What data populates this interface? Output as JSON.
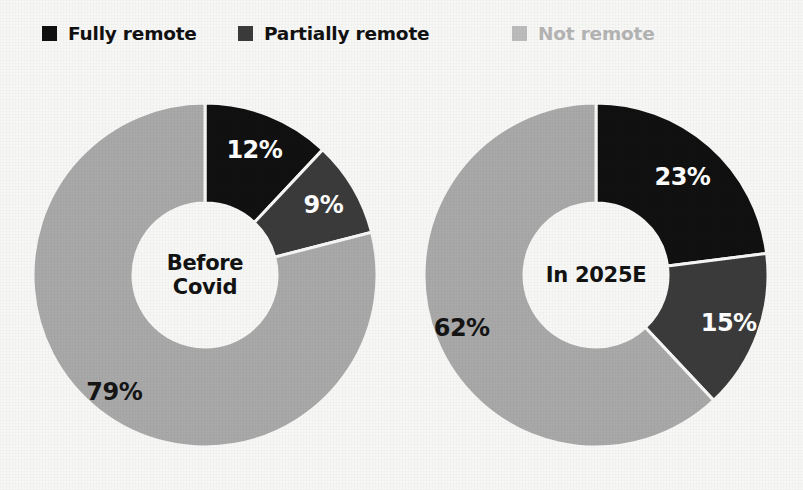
{
  "background_color": "#f7f7f6",
  "legend": {
    "items": [
      {
        "label": "Fully remote",
        "swatch_color": "#111111",
        "text_color": "#111111",
        "icon": "square-swatch-icon"
      },
      {
        "label": "Partially remote",
        "swatch_color": "#3b3b3b",
        "text_color": "#111111",
        "icon": "square-swatch-icon"
      },
      {
        "label": "Not remote",
        "swatch_color": "#bcbcbc",
        "text_color": "#b4b4b4",
        "icon": "square-swatch-icon"
      }
    ]
  },
  "chart_data": {
    "type": "pie",
    "title": "",
    "subtitle": "",
    "xlabel": "",
    "ylabel": "",
    "legend_position": "top",
    "grid": false,
    "donut": true,
    "inner_radius_ratio": 0.42,
    "start_angle_deg": 0,
    "direction": "clockwise",
    "categories": [
      "Fully remote",
      "Partially remote",
      "Not remote"
    ],
    "colors": [
      "#111111",
      "#3b3b3b",
      "#a9a9a9"
    ],
    "charts": [
      {
        "name": "before-covid",
        "center_label": "Before Covid",
        "center_label_lines": [
          "Before",
          "Covid"
        ],
        "values": [
          12,
          9,
          79
        ],
        "labels": [
          "12%",
          "9%",
          "79%"
        ],
        "label_colors": [
          "#ffffff",
          "#ffffff",
          "#151515"
        ]
      },
      {
        "name": "in-2025e",
        "center_label": "In 2025E",
        "center_label_lines": [
          "In 2025E"
        ],
        "values": [
          23,
          15,
          62
        ],
        "labels": [
          "23%",
          "15%",
          "62%"
        ],
        "label_colors": [
          "#ffffff",
          "#ffffff",
          "#151515"
        ]
      }
    ]
  }
}
